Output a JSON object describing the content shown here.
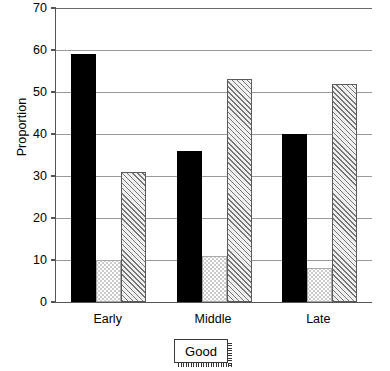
{
  "chart_data": {
    "type": "bar",
    "title": "",
    "xlabel": "",
    "ylabel": "Proportion",
    "categories": [
      "Early",
      "Middle",
      "Late"
    ],
    "ylim": [
      0,
      70
    ],
    "yticks": [
      0,
      10,
      20,
      30,
      40,
      50,
      60,
      70
    ],
    "ytick_labels": [
      "0",
      "10",
      "20",
      "30",
      "40",
      "50",
      "60",
      "70"
    ],
    "grid": true,
    "legend_position": "bottom-center",
    "series": [
      {
        "name": "series-1",
        "pattern": "solid-black",
        "values": [
          59,
          36,
          40
        ]
      },
      {
        "name": "series-2",
        "pattern": "dotted-stipple",
        "values": [
          10,
          11,
          8
        ]
      },
      {
        "name": "series-3",
        "pattern": "diagonal-hatch",
        "values": [
          31,
          53,
          52
        ]
      }
    ]
  },
  "legend": {
    "label": "Good"
  },
  "colors": {
    "series_1": "#000000",
    "series_2": "#ffffff",
    "series_3": "#efefef",
    "axis": "#555555",
    "grid": "#9a9a9a",
    "background": "#ffffff"
  }
}
